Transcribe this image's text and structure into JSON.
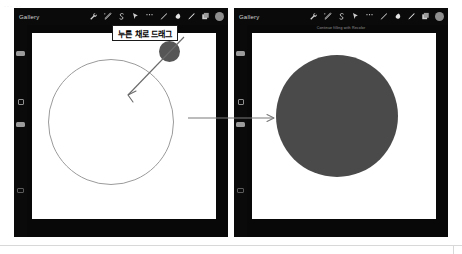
{
  "page": {
    "background_color": "#ffffff",
    "faint_marks": "···   ··"
  },
  "annotations": {
    "callout": {
      "text": "누른 채로 드래그",
      "name": "press-and-drag-callout",
      "border_color": "#1a1a1a",
      "background_color": "#ffffff"
    },
    "transition_arrow": {
      "name": "step-transition-arrow",
      "direction": "right",
      "color": "#777777"
    },
    "drag_pointer_arrow": {
      "name": "drag-direction-arrow",
      "direction": "down-left",
      "color": "#6a6a6a"
    }
  },
  "panels": [
    {
      "id": "left",
      "name": "procreate-before-panel",
      "toolbar": {
        "gallery_label": "Gallery",
        "icons": [
          {
            "name": "adjustments-wrench-icon",
            "glyph": "wrench"
          },
          {
            "name": "adjustments-magic-icon",
            "glyph": "magic"
          },
          {
            "name": "selection-s-icon",
            "glyph": "selection"
          },
          {
            "name": "transform-arrow-icon",
            "glyph": "transform"
          },
          {
            "name": "more-dots-icon",
            "glyph": "dots"
          },
          {
            "name": "brush-icon",
            "glyph": "brush"
          },
          {
            "name": "smudge-icon",
            "glyph": "smudge"
          },
          {
            "name": "eraser-icon",
            "glyph": "eraser"
          },
          {
            "name": "layers-icon",
            "glyph": "layers"
          }
        ],
        "color_swatch": "#8e8e8e"
      },
      "sub_caption": "",
      "rail": {
        "brush_size_slider": "brush-size-slider",
        "modify_button": "modify-square-button",
        "opacity_slider": "opacity-slider",
        "undo_button": "undo-button"
      },
      "canvas": {
        "background_color": "#ffffff",
        "shapes": [
          {
            "name": "outline-circle",
            "type": "circle",
            "fill": "none",
            "stroke": "#9b9b9b"
          },
          {
            "name": "color-drag-dot",
            "type": "circle",
            "fill": "#565656"
          }
        ]
      }
    },
    {
      "id": "right",
      "name": "procreate-after-panel",
      "toolbar": {
        "gallery_label": "Gallery",
        "icons": [
          {
            "name": "adjustments-wrench-icon",
            "glyph": "wrench"
          },
          {
            "name": "adjustments-magic-icon",
            "glyph": "magic"
          },
          {
            "name": "selection-s-icon",
            "glyph": "selection"
          },
          {
            "name": "transform-arrow-icon",
            "glyph": "transform"
          },
          {
            "name": "more-dots-icon",
            "glyph": "dots"
          },
          {
            "name": "brush-icon",
            "glyph": "brush"
          },
          {
            "name": "smudge-icon",
            "glyph": "smudge"
          },
          {
            "name": "eraser-icon",
            "glyph": "eraser"
          },
          {
            "name": "layers-icon",
            "glyph": "layers"
          }
        ],
        "color_swatch": "#8e8e8e"
      },
      "sub_caption": "Continue filling with Recolor",
      "rail": {
        "brush_size_slider": "brush-size-slider",
        "modify_button": "modify-square-button",
        "opacity_slider": "opacity-slider",
        "undo_button": "undo-button"
      },
      "canvas": {
        "background_color": "#ffffff",
        "shapes": [
          {
            "name": "filled-circle",
            "type": "circle",
            "fill": "#4a4a4a",
            "stroke": "none"
          }
        ]
      }
    }
  ]
}
